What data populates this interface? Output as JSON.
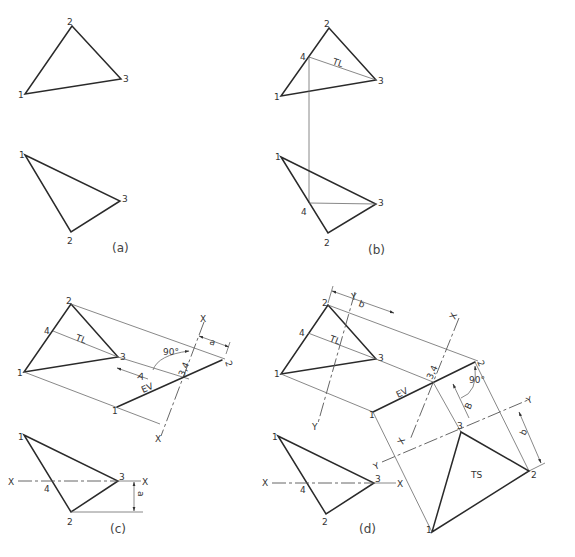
{
  "figure": {
    "panels": [
      {
        "id": "a",
        "caption": "(a)",
        "top_view": {
          "points": {
            "1": "1",
            "2": "2",
            "3": "3"
          }
        },
        "front_view": {
          "points": {
            "1": "1",
            "2": "2",
            "3": "3"
          }
        }
      },
      {
        "id": "b",
        "caption": "(b)",
        "top_view": {
          "points": {
            "1": "1",
            "2": "2",
            "3": "3",
            "4": "4"
          },
          "line_label": "TL"
        },
        "front_view": {
          "points": {
            "1": "1",
            "2": "2",
            "3": "3",
            "4": "4"
          }
        }
      },
      {
        "id": "c",
        "caption": "(c)",
        "top_view": {
          "points": {
            "1": "1",
            "2": "2",
            "3": "3",
            "4": "4"
          },
          "line_label": "TL"
        },
        "aux_view": {
          "point_1": "1",
          "point_2": "2",
          "point_34": "3,4",
          "edge_label": "EV",
          "arrow_label": "A",
          "angle": "90°",
          "dim": "a",
          "fold_x_top": "X",
          "fold_x_bottom": "X"
        },
        "front_view": {
          "points": {
            "1": "1",
            "2": "2",
            "3": "3",
            "4": "4"
          },
          "fold_x_left": "X",
          "fold_x_right": "X",
          "dim": "a"
        }
      },
      {
        "id": "d",
        "caption": "(d)",
        "top_view": {
          "points": {
            "1": "1",
            "2": "2",
            "3": "3",
            "4": "4"
          },
          "line_label": "TL",
          "dim": "b",
          "fold_y_top": "Y",
          "fold_y_bottom": "Y"
        },
        "aux_view": {
          "point_1": "1",
          "point_2": "2",
          "point_34": "3,4",
          "edge_label": "EV",
          "angle": "90°",
          "arrow_label": "B",
          "fold_x_top": "X",
          "fold_x_bottom": "X"
        },
        "true_shape": {
          "point_1": "1",
          "point_2": "2",
          "point_3": "3",
          "label": "TS",
          "dim": "b",
          "fold_y_left": "Y",
          "fold_y_right": "Y"
        },
        "front_view": {
          "points": {
            "1": "1",
            "2": "2",
            "3": "3",
            "4": "4"
          },
          "fold_x_left": "X",
          "fold_x_right": "X"
        }
      }
    ]
  }
}
